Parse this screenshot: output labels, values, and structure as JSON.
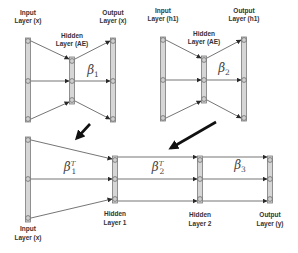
{
  "diagram": {
    "autoencoder_1": {
      "input_label_line1": "Input",
      "input_label_line2": "Layer (x)",
      "hidden_label_line1": "Hidden",
      "hidden_label_line2": "Layer (AE)",
      "output_label_line1": "Output",
      "output_label_line2": "Layer (x)",
      "weight_symbol": "β",
      "weight_subscript": "1"
    },
    "autoencoder_2": {
      "input_label_line1": "Input",
      "input_label_line2": "Layer (h1)",
      "hidden_label_line1": "Hidden",
      "hidden_label_line2": "Layer (AE)",
      "output_label_line1": "Output",
      "output_label_line2": "Layer (h1)",
      "weight_symbol": "β",
      "weight_subscript": "2"
    },
    "deep_network": {
      "input_label_line1": "Input",
      "input_label_line2": "Layer (x)",
      "hidden1_label_line1": "Hidden",
      "hidden1_label_line2": "Layer 1",
      "hidden2_label_line1": "Hidden",
      "hidden2_label_line2": "Layer 2",
      "output_label_line1": "Output",
      "output_label_line2": "Layer (y)",
      "weights": [
        {
          "symbol": "β",
          "subscript": "1",
          "superscript": "T"
        },
        {
          "symbol": "β",
          "subscript": "2",
          "superscript": "T"
        },
        {
          "symbol": "β",
          "subscript": "3",
          "superscript": ""
        }
      ]
    },
    "colors": {
      "layer_fill": "#d6d6d6",
      "layer_stroke": "#7a7a7a",
      "connection": "#3a3a3a",
      "transfer_arrow": "#111111"
    }
  }
}
